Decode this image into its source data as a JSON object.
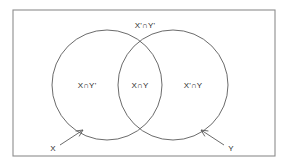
{
  "figure": {
    "background_color": "#ffffff",
    "border_color": "#8d8d8d",
    "stroke_color": "#5a5a5a",
    "text_color": "#2b2b2b"
  },
  "regions": [
    {
      "id": "outside-both",
      "label": "X'∩Y'",
      "description": "region outside both circles, inside the universal set rectangle",
      "x": 145,
      "y": 26
    },
    {
      "id": "x-only",
      "label": "X∩Y'",
      "description": "left circle only",
      "x": 87,
      "y": 86
    },
    {
      "id": "intersection",
      "label": "X∩Y",
      "description": "overlap of both circles",
      "x": 140,
      "y": 86
    },
    {
      "id": "y-only",
      "label": "X'∩Y",
      "description": "right circle only",
      "x": 193,
      "y": 86
    }
  ],
  "set_callouts": [
    {
      "id": "x",
      "label": "X",
      "label_x": 53,
      "label_y": 149,
      "arrow_from_x": 60,
      "arrow_from_y": 145,
      "arrow_to_x": 83,
      "arrow_to_y": 130
    },
    {
      "id": "y",
      "label": "Y",
      "label_x": 231,
      "label_y": 149,
      "arrow_from_x": 224,
      "arrow_from_y": 145,
      "arrow_to_x": 201,
      "arrow_to_y": 130
    }
  ],
  "circles": [
    {
      "id": "circle-x",
      "cx": 107,
      "cy": 85,
      "r": 55
    },
    {
      "id": "circle-y",
      "cx": 173,
      "cy": 85,
      "r": 55
    }
  ],
  "universe": {
    "id": "universal-set-rect",
    "x": 13,
    "y": 10,
    "width": 262,
    "height": 146
  }
}
